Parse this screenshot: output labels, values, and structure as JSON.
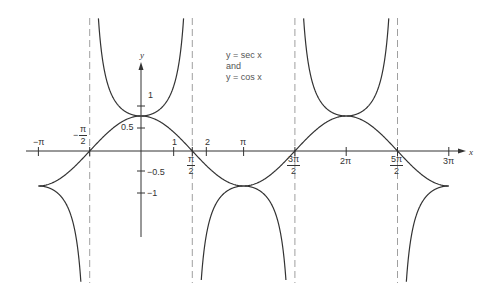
{
  "chart_data": {
    "type": "line",
    "title": "y = sec x and y = cos x",
    "xlabel": "x",
    "ylabel": "y",
    "xlim": [
      -3.1416,
      9.4248
    ],
    "ylim": [
      -3,
      3
    ],
    "grid": false,
    "legend": {
      "position": "top-center",
      "lines": [
        "y = sec x",
        "and",
        "y = cos x"
      ]
    },
    "series": [
      {
        "name": "y = cos x",
        "function": "cos(x)",
        "x": [
          -3.1416,
          -1.5708,
          0,
          1.5708,
          3.1416,
          4.7124,
          6.2832,
          7.854,
          9.4248
        ],
        "values": [
          -1,
          0,
          1,
          0,
          -1,
          0,
          1,
          0,
          -1
        ]
      },
      {
        "name": "y = sec x",
        "function": "1/cos(x)",
        "x": [
          -3.1416,
          0,
          3.1416,
          6.2832,
          9.4248
        ],
        "values": [
          -1,
          1,
          -1,
          1,
          -1
        ]
      }
    ],
    "asymptotes_x": [
      "-π/2",
      "π/2",
      "3π/2",
      "5π/2"
    ],
    "x_ticks": [
      {
        "label": "−π",
        "value": -3.1416
      },
      {
        "label": "−π/2",
        "value": -1.5708
      },
      {
        "label": "1",
        "value": 1
      },
      {
        "label": "π/2",
        "value": 1.5708
      },
      {
        "label": "2",
        "value": 2
      },
      {
        "label": "π",
        "value": 3.1416
      },
      {
        "label": "3π/2",
        "value": 4.7124
      },
      {
        "label": "2π",
        "value": 6.2832
      },
      {
        "label": "5π/2",
        "value": 7.854
      },
      {
        "label": "3π",
        "value": 9.4248
      }
    ],
    "y_ticks": [
      {
        "label": "1",
        "value": 1
      },
      {
        "label": "0.5",
        "value": 0.5
      },
      {
        "label": "−0.5",
        "value": -0.5
      },
      {
        "label": "−1",
        "value": -1
      }
    ]
  },
  "labels": {
    "axis_x": "x",
    "axis_y": "y",
    "neg_pi": "−π",
    "pi": "π",
    "two_pi": "2π",
    "three_pi": "3π",
    "one": "1",
    "two": "2",
    "y_one": "1",
    "y_half": "0.5",
    "y_neg_half": "−0.5",
    "y_neg_one": "−1",
    "neg_sign": "−",
    "pi_sym": "π",
    "den2": "2",
    "three_pi_num": "3π",
    "five_pi_num": "5π",
    "legend_line1": "y = sec x",
    "legend_line2": "and",
    "legend_line3": "y = cos x"
  },
  "colors": {
    "curve": "#333333",
    "axis": "#333333",
    "asymptote": "#777777"
  }
}
